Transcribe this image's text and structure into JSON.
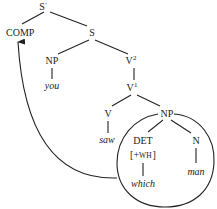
{
  "diagram": {
    "type": "syntax-tree",
    "nodes": {
      "s_bar": {
        "label": "S",
        "prime": "′"
      },
      "comp": {
        "label": "COMP"
      },
      "s": {
        "label": "S"
      },
      "np_subj": {
        "label": "NP"
      },
      "you": {
        "label": "you"
      },
      "v2": {
        "label": "V",
        "sup": "2"
      },
      "v1": {
        "label": "V",
        "sup": "1"
      },
      "v": {
        "label": "V"
      },
      "saw": {
        "label": "saw"
      },
      "np_obj": {
        "label": "NP"
      },
      "det": {
        "label": "DET"
      },
      "det_feature_open": {
        "label": "[+"
      },
      "det_feature_wh": {
        "label": "WH"
      },
      "det_feature_close": {
        "label": "]"
      },
      "which": {
        "label": "which"
      },
      "n": {
        "label": "N"
      },
      "man": {
        "label": "man"
      }
    },
    "edges": [
      [
        "s_bar",
        "comp"
      ],
      [
        "s_bar",
        "s"
      ],
      [
        "s",
        "np_subj"
      ],
      [
        "s",
        "v2"
      ],
      [
        "np_subj",
        "you"
      ],
      [
        "v2",
        "v1"
      ],
      [
        "v1",
        "v"
      ],
      [
        "v1",
        "np_obj"
      ],
      [
        "v",
        "saw"
      ],
      [
        "np_obj",
        "det"
      ],
      [
        "np_obj",
        "n"
      ],
      [
        "det",
        "which"
      ],
      [
        "n",
        "man"
      ]
    ],
    "annotations": {
      "circle": "encircles object NP (which man)",
      "movement_arrow": "from circled NP to COMP"
    }
  }
}
